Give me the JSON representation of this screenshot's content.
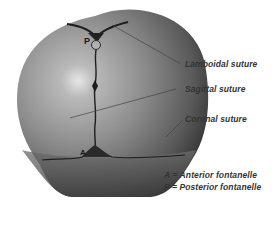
{
  "diagram": {
    "markers": {
      "posterior": "P",
      "anterior": "A"
    },
    "labels": [
      {
        "id": "lamboidal",
        "text": "Lamboidal suture"
      },
      {
        "id": "sagittal",
        "text": "Sagittal suture"
      },
      {
        "id": "coronal",
        "text": "Coronal suture"
      }
    ],
    "legend": [
      {
        "text": "A = Anterior fontanelle"
      },
      {
        "text": "P = Posterior fontanelle"
      }
    ],
    "colors": {
      "skull_light": "#c8c8c8",
      "skull_mid": "#8a8a8a",
      "skull_dark": "#3a3a3a",
      "suture": "#1e1e1e",
      "leader_line": "#444444",
      "text": "#333333"
    }
  }
}
